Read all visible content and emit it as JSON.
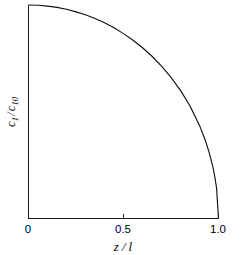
{
  "chart_data": {
    "type": "line",
    "title": "",
    "subtitle": "",
    "xlabel": "z / l",
    "ylabel": "c₁/c₁₀",
    "xlim": [
      0,
      1
    ],
    "ylim": [
      0,
      1
    ],
    "grid": false,
    "legend": null,
    "legend_position": "none",
    "xticks": [
      {
        "value": 0,
        "label": "0"
      },
      {
        "value": 0.5,
        "label": "0.5"
      },
      {
        "value": 1.0,
        "label": "1.0"
      }
    ],
    "yticks": [],
    "annotations": [],
    "series": [
      {
        "name": "concentration-profile",
        "color": "#111111",
        "x": [
          0.0,
          0.05,
          0.1,
          0.15,
          0.2,
          0.25,
          0.3,
          0.35,
          0.4,
          0.45,
          0.5,
          0.55,
          0.6,
          0.65,
          0.7,
          0.75,
          0.8,
          0.85,
          0.9,
          0.93,
          0.95,
          0.97,
          0.98,
          0.99,
          1.0
        ],
        "y": [
          1.0,
          0.999,
          0.995,
          0.989,
          0.98,
          0.968,
          0.954,
          0.937,
          0.917,
          0.893,
          0.866,
          0.835,
          0.8,
          0.76,
          0.714,
          0.661,
          0.6,
          0.527,
          0.436,
          0.368,
          0.312,
          0.243,
          0.199,
          0.141,
          0.0
        ]
      }
    ]
  },
  "axis_labels": {
    "x_title_var": "z",
    "x_title_sep": "/",
    "x_title_denom": "l",
    "y_title_num_var": "c",
    "y_title_num_sub": "1",
    "y_title_sep": "/",
    "y_title_den_var": "c",
    "y_title_den_sub": "10"
  },
  "colors": {
    "background": "#ffffff",
    "axis": "#1a1a1a",
    "curve": "#111111",
    "text": "#000000"
  }
}
